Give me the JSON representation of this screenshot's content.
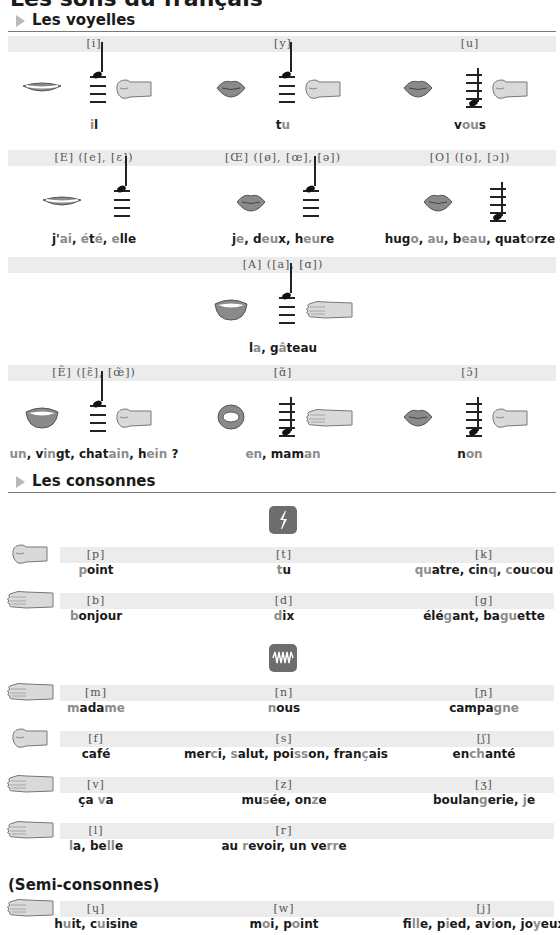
{
  "page": {
    "title": "Les sons du français"
  },
  "vowels": {
    "heading": "Les voyelles",
    "rows": [
      {
        "cells": [
          {
            "ipa": "[i]",
            "lips": "spread",
            "note": "high",
            "hand": "fist",
            "word": [
              {
                "t": "i",
                "h": true
              },
              {
                "t": "l",
                "h": false
              }
            ]
          },
          {
            "ipa": "[y]",
            "lips": "rounded",
            "note": "high",
            "hand": "fist",
            "word": [
              {
                "t": "t",
                "h": false
              },
              {
                "t": "u",
                "h": true
              }
            ]
          },
          {
            "ipa": "[u]",
            "lips": "rounded",
            "note": "low",
            "hand": "fist",
            "word": [
              {
                "t": "v",
                "h": false
              },
              {
                "t": "ou",
                "h": true
              },
              {
                "t": "s",
                "h": false
              }
            ]
          }
        ]
      },
      {
        "cells": [
          {
            "ipa": "[E] ([e], [ɛ])",
            "lips": "spread",
            "note": "high",
            "hand": "",
            "word": [
              {
                "t": "j'",
                "h": false
              },
              {
                "t": "ai",
                "h": true
              },
              {
                "t": ", ",
                "h": false
              },
              {
                "t": "é",
                "h": true
              },
              {
                "t": "t",
                "h": false
              },
              {
                "t": "é",
                "h": true
              },
              {
                "t": ", ",
                "h": false
              },
              {
                "t": "e",
                "h": true
              },
              {
                "t": "lle",
                "h": false
              }
            ]
          },
          {
            "ipa": "[Œ] ([ø], [œ], [ə])",
            "lips": "rounded",
            "note": "high",
            "hand": "",
            "word": [
              {
                "t": "j",
                "h": false
              },
              {
                "t": "e",
                "h": true
              },
              {
                "t": ", d",
                "h": false
              },
              {
                "t": "eu",
                "h": true
              },
              {
                "t": "x, h",
                "h": false
              },
              {
                "t": "eu",
                "h": true
              },
              {
                "t": "re",
                "h": false
              }
            ]
          },
          {
            "ipa": "[O] ([o], [ɔ])",
            "lips": "rounded",
            "note": "low",
            "hand": "",
            "word": [
              {
                "t": "hug",
                "h": false
              },
              {
                "t": "o",
                "h": true
              },
              {
                "t": ", ",
                "h": false
              },
              {
                "t": "au",
                "h": true
              },
              {
                "t": ", b",
                "h": false
              },
              {
                "t": "eau",
                "h": true
              },
              {
                "t": ", quat",
                "h": false
              },
              {
                "t": "o",
                "h": true
              },
              {
                "t": "rze",
                "h": false
              }
            ]
          }
        ]
      },
      {
        "cells": [
          {
            "ipa": "[A] ([a], [ɑ])",
            "lips": "open",
            "note": "high",
            "hand": "flat",
            "word": [
              {
                "t": "l",
                "h": false
              },
              {
                "t": "a",
                "h": true
              },
              {
                "t": ", g",
                "h": false
              },
              {
                "t": "â",
                "h": true
              },
              {
                "t": "teau",
                "h": false
              }
            ]
          }
        ]
      },
      {
        "cells": [
          {
            "ipa": "[Ẽ] ([ɛ̃], [œ̃])",
            "lips": "open",
            "note": "high",
            "hand": "fist",
            "word": [
              {
                "t": "un",
                "h": true
              },
              {
                "t": ", v",
                "h": false
              },
              {
                "t": "in",
                "h": true
              },
              {
                "t": "gt, chat",
                "h": false
              },
              {
                "t": "ain",
                "h": true
              },
              {
                "t": ", h",
                "h": false
              },
              {
                "t": "ein",
                "h": true
              },
              {
                "t": " ?",
                "h": false
              }
            ]
          },
          {
            "ipa": "[ɑ̃]",
            "lips": "round-open",
            "note": "low",
            "hand": "flat",
            "word": [
              {
                "t": "en",
                "h": true
              },
              {
                "t": ", mam",
                "h": false
              },
              {
                "t": "an",
                "h": true
              }
            ]
          },
          {
            "ipa": "[ɔ̃]",
            "lips": "rounded",
            "note": "low",
            "hand": "fist",
            "word": [
              {
                "t": "n",
                "h": false
              },
              {
                "t": "on",
                "h": true
              }
            ]
          }
        ]
      }
    ]
  },
  "consonants": {
    "heading": "Les consonnes",
    "plosive_icon": "lightning-icon",
    "continuant_icon": "wave-icon",
    "rows": [
      {
        "hand": "fist",
        "cells": [
          {
            "ipa": "[p]",
            "word": [
              {
                "t": "p",
                "h": true
              },
              {
                "t": "oint",
                "h": false
              }
            ]
          },
          {
            "ipa": "[t]",
            "word": [
              {
                "t": "t",
                "h": true
              },
              {
                "t": "u",
                "h": false
              }
            ]
          },
          {
            "ipa": "[k]",
            "word": [
              {
                "t": "qu",
                "h": true
              },
              {
                "t": "atre, cin",
                "h": false
              },
              {
                "t": "q",
                "h": true
              },
              {
                "t": ", ",
                "h": false
              },
              {
                "t": "c",
                "h": true
              },
              {
                "t": "ou",
                "h": false
              },
              {
                "t": "c",
                "h": true
              },
              {
                "t": "ou",
                "h": false
              }
            ]
          }
        ]
      },
      {
        "hand": "flat",
        "cells": [
          {
            "ipa": "[b]",
            "word": [
              {
                "t": "b",
                "h": true
              },
              {
                "t": "onjour",
                "h": false
              }
            ]
          },
          {
            "ipa": "[d]",
            "word": [
              {
                "t": "d",
                "h": true
              },
              {
                "t": "ix",
                "h": false
              }
            ]
          },
          {
            "ipa": "[g]",
            "word": [
              {
                "t": "élé",
                "h": false
              },
              {
                "t": "g",
                "h": true
              },
              {
                "t": "ant, ba",
                "h": false
              },
              {
                "t": "gu",
                "h": true
              },
              {
                "t": "ette",
                "h": false
              }
            ]
          }
        ]
      },
      {
        "hand": "flat",
        "cells": [
          {
            "ipa": "[m]",
            "word": [
              {
                "t": "m",
                "h": true
              },
              {
                "t": "ada",
                "h": false
              },
              {
                "t": "me",
                "h": true
              }
            ]
          },
          {
            "ipa": "[n]",
            "word": [
              {
                "t": "n",
                "h": true
              },
              {
                "t": "ous",
                "h": false
              }
            ]
          },
          {
            "ipa": "[ɲ]",
            "word": [
              {
                "t": "campa",
                "h": false
              },
              {
                "t": "gne",
                "h": true
              }
            ]
          }
        ]
      },
      {
        "hand": "fist",
        "cells": [
          {
            "ipa": "[f]",
            "word": [
              {
                "t": "café",
                "h": false
              }
            ]
          },
          {
            "ipa": "[s]",
            "word": [
              {
                "t": "mer",
                "h": false
              },
              {
                "t": "c",
                "h": true
              },
              {
                "t": "i, ",
                "h": false
              },
              {
                "t": "s",
                "h": true
              },
              {
                "t": "alut, poi",
                "h": false
              },
              {
                "t": "ss",
                "h": true
              },
              {
                "t": "on, fran",
                "h": false
              },
              {
                "t": "ç",
                "h": true
              },
              {
                "t": "ais",
                "h": false
              }
            ]
          },
          {
            "ipa": "[ʃ]",
            "word": [
              {
                "t": "en",
                "h": false
              },
              {
                "t": "ch",
                "h": true
              },
              {
                "t": "anté",
                "h": false
              }
            ]
          }
        ]
      },
      {
        "hand": "flat",
        "cells": [
          {
            "ipa": "[v]",
            "word": [
              {
                "t": "ça ",
                "h": false
              },
              {
                "t": "v",
                "h": true
              },
              {
                "t": "a",
                "h": false
              }
            ]
          },
          {
            "ipa": "[z]",
            "word": [
              {
                "t": "mu",
                "h": false
              },
              {
                "t": "s",
                "h": true
              },
              {
                "t": "ée, on",
                "h": false
              },
              {
                "t": "z",
                "h": true
              },
              {
                "t": "e",
                "h": false
              }
            ]
          },
          {
            "ipa": "[ʒ]",
            "word": [
              {
                "t": "boulan",
                "h": false
              },
              {
                "t": "g",
                "h": true
              },
              {
                "t": "erie, ",
                "h": false
              },
              {
                "t": "j",
                "h": true
              },
              {
                "t": "e",
                "h": false
              }
            ]
          }
        ]
      },
      {
        "hand": "flat",
        "cells": [
          {
            "ipa": "[l]",
            "word": [
              {
                "t": "l",
                "h": true
              },
              {
                "t": "a, be",
                "h": false
              },
              {
                "t": "ll",
                "h": true
              },
              {
                "t": "e",
                "h": false
              }
            ]
          },
          {
            "ipa": "[r]",
            "word": [
              {
                "t": "au ",
                "h": false
              },
              {
                "t": "r",
                "h": true
              },
              {
                "t": "evoir, un ve",
                "h": false
              },
              {
                "t": "rr",
                "h": true
              },
              {
                "t": "e",
                "h": false
              }
            ]
          }
        ]
      }
    ],
    "semi": {
      "heading": "(Semi-consonnes)",
      "hand": "flat",
      "cells": [
        {
          "ipa": "[ɥ]",
          "word": [
            {
              "t": "h",
              "h": false
            },
            {
              "t": "u",
              "h": true
            },
            {
              "t": "it, c",
              "h": false
            },
            {
              "t": "u",
              "h": true
            },
            {
              "t": "isine",
              "h": false
            }
          ]
        },
        {
          "ipa": "[w]",
          "word": [
            {
              "t": "m",
              "h": false
            },
            {
              "t": "o",
              "h": true
            },
            {
              "t": "i, p",
              "h": false
            },
            {
              "t": "o",
              "h": true
            },
            {
              "t": "int",
              "h": false
            }
          ]
        },
        {
          "ipa": "[j]",
          "word": [
            {
              "t": "fi",
              "h": false
            },
            {
              "t": "ll",
              "h": true
            },
            {
              "t": "e, p",
              "h": false
            },
            {
              "t": "i",
              "h": true
            },
            {
              "t": "ed, av",
              "h": false
            },
            {
              "t": "i",
              "h": true
            },
            {
              "t": "on, jo",
              "h": false
            },
            {
              "t": "y",
              "h": true
            },
            {
              "t": "eux",
              "h": false
            }
          ]
        }
      ]
    }
  },
  "colors": {
    "text": "#1a1a1a",
    "highlight": "#8c8c8c",
    "band": "#ececec",
    "icon_box": "#6d6d6d",
    "lips": "#8a8a8a",
    "hand": "#d9d9d9"
  }
}
